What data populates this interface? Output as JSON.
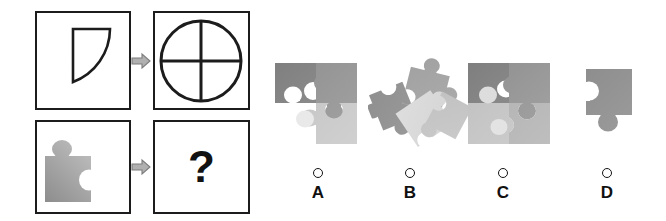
{
  "puzzle": {
    "type": "visual-analogy-matrix",
    "question_mark": "?",
    "arrow_glyph": "arrow-right",
    "matrix": {
      "rows": [
        {
          "name": "row-1-example",
          "source_cell": {
            "name": "quarter-circle-shape",
            "description": "quarter circle outline, corner at top-left",
            "stroke": "#1c1c1c",
            "fill": "#ffffff"
          },
          "relation_icon": "arrow-right-icon",
          "target_cell": {
            "name": "full-circle-quadrants",
            "description": "full circle divided into four quadrants by vertical and horizontal lines",
            "stroke": "#1c1c1c",
            "fill": "#ffffff"
          }
        },
        {
          "name": "row-2-question",
          "source_cell": {
            "name": "single-puzzle-piece",
            "description": "single jigsaw piece, tab on top, notch on right, gray gradient",
            "fill_light": "#d9d9d9",
            "fill_dark": "#8a8a8a"
          },
          "relation_icon": "arrow-right-icon",
          "target_cell": {
            "name": "unknown-answer",
            "label": "?"
          }
        }
      ]
    }
  },
  "options": [
    {
      "id": "A",
      "label": "A",
      "name": "option-a",
      "description": "2x2 jigsaw square with bottom-left piece missing",
      "selected": false,
      "pieces": [
        {
          "position": "top-left",
          "color": "#8d8d8d"
        },
        {
          "position": "top-right",
          "color": "#9a9a9a"
        },
        {
          "position": "bottom-left",
          "color": "#ffffff"
        },
        {
          "position": "bottom-right",
          "color": "#c9c9c9"
        }
      ]
    },
    {
      "id": "B",
      "label": "B",
      "name": "option-b",
      "description": "four jigsaw pieces scattered and overlapping at random angles",
      "selected": false,
      "pieces": [
        {
          "position": "upper-right-rotated",
          "color": "#949494"
        },
        {
          "position": "left-rotated",
          "color": "#a3a3a3"
        },
        {
          "position": "center-light-rotated",
          "color": "#e2e2e2"
        },
        {
          "position": "lower-right-rotated",
          "color": "#bdbdbd"
        }
      ]
    },
    {
      "id": "C",
      "label": "C",
      "name": "option-c",
      "description": "complete 2x2 jigsaw square of four interlocked pieces",
      "selected": false,
      "pieces": [
        {
          "position": "top-left",
          "color": "#8d8d8d"
        },
        {
          "position": "top-right",
          "color": "#9c9c9c"
        },
        {
          "position": "bottom-left",
          "color": "#c4c4c4"
        },
        {
          "position": "bottom-right",
          "color": "#b4b4b4"
        }
      ]
    },
    {
      "id": "D",
      "label": "D",
      "name": "option-d",
      "description": "single jigsaw piece with notch on left and tab on bottom",
      "selected": false,
      "pieces": [
        {
          "position": "single",
          "color": "#959595"
        }
      ]
    }
  ],
  "colors": {
    "background": "#ffffff",
    "outline": "#1c1c1c",
    "arrow_fill": "#b0b0b0",
    "arrow_stroke": "#7a7a7a",
    "text": "#101010"
  }
}
